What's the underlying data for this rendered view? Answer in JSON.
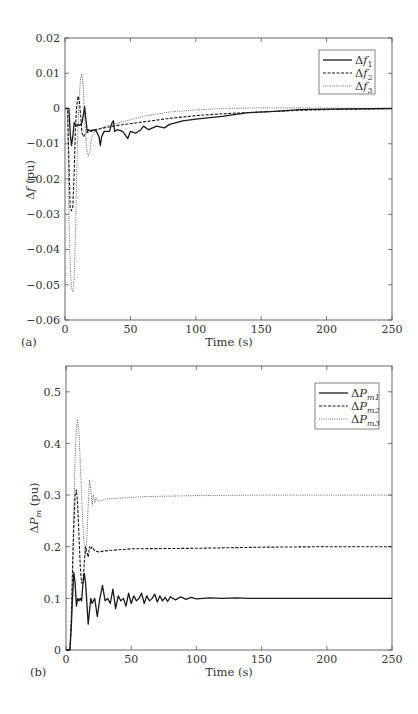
{
  "chart_data": [
    {
      "panel": "(a)",
      "type": "line",
      "title": "",
      "xlabel": "Time (s)",
      "ylabel": "Δf (pu)",
      "xlim": [
        0,
        250
      ],
      "ylim": [
        -0.06,
        0.02
      ],
      "xticks": [
        0,
        50,
        100,
        150,
        200,
        250
      ],
      "yticks": [
        -0.06,
        -0.05,
        -0.04,
        -0.03,
        -0.02,
        -0.01,
        0,
        0.01,
        0.02
      ],
      "ytick_labels": [
        "−0.06",
        "−0.05",
        "−0.04",
        "−0.03",
        "−0.02",
        "−0.01",
        "0",
        "0.01",
        "0.02"
      ],
      "grid": false,
      "legend_position": "upper right",
      "series": [
        {
          "name": "Δf1",
          "style": "solid",
          "x": [
            0,
            3,
            4,
            5,
            6,
            7,
            8,
            9,
            10,
            11,
            12,
            13,
            14,
            15,
            16,
            17,
            18,
            20,
            22,
            24,
            26,
            27,
            28,
            30,
            34,
            36,
            37,
            38,
            40,
            44,
            46,
            48,
            50,
            54,
            58,
            60,
            64,
            70,
            76,
            80,
            90,
            100,
            120,
            140,
            160,
            180,
            200,
            250
          ],
          "values": [
            0,
            0,
            -0.007,
            -0.0105,
            -0.008,
            -0.004,
            -0.0045,
            -0.005,
            -0.0045,
            -0.0048,
            -0.0045,
            -0.004,
            -0.002,
            0.0005,
            -0.003,
            -0.0065,
            -0.006,
            -0.0065,
            -0.006,
            -0.0065,
            -0.008,
            -0.0105,
            -0.008,
            -0.0065,
            -0.0065,
            -0.004,
            -0.0035,
            -0.0065,
            -0.006,
            -0.0065,
            -0.0075,
            -0.0085,
            -0.0065,
            -0.007,
            -0.006,
            -0.005,
            -0.006,
            -0.005,
            -0.0055,
            -0.0045,
            -0.0035,
            -0.003,
            -0.0022,
            -0.0012,
            -0.0008,
            -0.0003,
            -0.0002,
            0
          ]
        },
        {
          "name": "Δf2",
          "style": "dashed",
          "x": [
            0,
            2,
            3,
            4,
            5,
            6,
            7,
            8,
            9,
            10,
            11,
            12,
            13,
            14,
            15,
            16,
            20,
            30,
            40,
            60,
            80,
            100,
            120,
            150,
            180,
            200,
            250
          ],
          "values": [
            0,
            0,
            -0.015,
            -0.028,
            -0.029,
            -0.028,
            -0.018,
            -0.005,
            0.001,
            0.0035,
            0.002,
            -0.002,
            -0.007,
            -0.008,
            -0.0075,
            -0.007,
            -0.0062,
            -0.0055,
            -0.0048,
            -0.0038,
            -0.0028,
            -0.002,
            -0.0015,
            -0.001,
            -0.0005,
            -0.0003,
            0
          ]
        },
        {
          "name": "Δf3",
          "style": "dotted",
          "x": [
            0,
            2,
            3,
            4,
            5,
            6,
            7,
            8,
            9,
            10,
            11,
            12,
            13,
            14,
            15,
            16,
            17,
            18,
            19,
            20,
            22,
            25,
            30,
            40,
            60,
            80,
            100,
            120,
            150,
            200,
            250
          ],
          "values": [
            0,
            0,
            -0.03,
            -0.045,
            -0.051,
            -0.052,
            -0.048,
            -0.035,
            -0.018,
            -0.004,
            0.004,
            0.009,
            0.0098,
            0.006,
            -0.002,
            -0.009,
            -0.0125,
            -0.0135,
            -0.012,
            -0.009,
            -0.0065,
            -0.006,
            -0.0052,
            -0.0042,
            -0.0022,
            -0.001,
            -0.0004,
            0,
            0.0002,
            0.0001,
            0
          ]
        }
      ]
    },
    {
      "panel": "(b)",
      "type": "line",
      "title": "",
      "xlabel": "Time (s)",
      "ylabel": "ΔPm (pu)",
      "xlim": [
        0,
        250
      ],
      "ylim": [
        0,
        0.55
      ],
      "xticks": [
        0,
        50,
        100,
        150,
        200,
        250
      ],
      "yticks": [
        0,
        0.1,
        0.2,
        0.3,
        0.4,
        0.5
      ],
      "ytick_labels": [
        "0",
        "0.1",
        "0.2",
        "0.3",
        "0.4",
        "0.5"
      ],
      "grid": false,
      "legend_position": "upper right",
      "series": [
        {
          "name": "ΔPm1",
          "style": "solid",
          "x": [
            0,
            3,
            4,
            5,
            6,
            7,
            8,
            9,
            10,
            11,
            12,
            13,
            14,
            15,
            16,
            17,
            18,
            19,
            20,
            22,
            24,
            26,
            28,
            30,
            32,
            34,
            36,
            38,
            40,
            42,
            44,
            46,
            48,
            50,
            52,
            54,
            56,
            58,
            60,
            62,
            64,
            66,
            68,
            70,
            72,
            74,
            76,
            78,
            80,
            84,
            88,
            92,
            96,
            100,
            110,
            120,
            130,
            140,
            250
          ],
          "values": [
            0,
            0,
            0.04,
            0.1,
            0.15,
            0.13,
            0.085,
            0.1,
            0.095,
            0.1,
            0.095,
            0.13,
            0.148,
            0.13,
            0.09,
            0.05,
            0.075,
            0.1,
            0.09,
            0.1,
            0.065,
            0.1,
            0.125,
            0.095,
            0.1,
            0.09,
            0.118,
            0.08,
            0.105,
            0.095,
            0.1,
            0.085,
            0.11,
            0.09,
            0.105,
            0.095,
            0.1,
            0.11,
            0.09,
            0.105,
            0.095,
            0.1,
            0.108,
            0.093,
            0.105,
            0.095,
            0.102,
            0.094,
            0.103,
            0.097,
            0.103,
            0.098,
            0.102,
            0.099,
            0.101,
            0.1,
            0.101,
            0.1,
            0.1
          ]
        },
        {
          "name": "ΔPm2",
          "style": "dashed",
          "x": [
            0,
            3,
            4,
            5,
            6,
            7,
            8,
            9,
            10,
            11,
            12,
            13,
            14,
            15,
            16,
            17,
            18,
            19,
            20,
            22,
            25,
            30,
            40,
            50,
            100,
            150,
            200,
            250
          ],
          "values": [
            0,
            0,
            0.05,
            0.15,
            0.24,
            0.3,
            0.31,
            0.28,
            0.22,
            0.16,
            0.13,
            0.13,
            0.17,
            0.2,
            0.19,
            0.18,
            0.2,
            0.195,
            0.2,
            0.192,
            0.19,
            0.192,
            0.194,
            0.196,
            0.197,
            0.199,
            0.2,
            0.2
          ]
        },
        {
          "name": "ΔPm3",
          "style": "dotted",
          "x": [
            0,
            3,
            4,
            5,
            6,
            7,
            8,
            9,
            10,
            11,
            12,
            13,
            14,
            15,
            16,
            17,
            18,
            19,
            20,
            21,
            22,
            23,
            24,
            26,
            30,
            40,
            60,
            100,
            150,
            200,
            250
          ],
          "values": [
            0,
            0,
            0.06,
            0.16,
            0.27,
            0.37,
            0.43,
            0.445,
            0.42,
            0.36,
            0.3,
            0.24,
            0.2,
            0.185,
            0.22,
            0.28,
            0.33,
            0.31,
            0.28,
            0.3,
            0.285,
            0.295,
            0.29,
            0.288,
            0.292,
            0.294,
            0.297,
            0.299,
            0.3,
            0.3,
            0.3
          ]
        }
      ]
    }
  ],
  "panels": {
    "a": {
      "label": "(a)",
      "xlabel": "Time (s)",
      "ylabel_prefix": "Δ",
      "ylabel_var": "f",
      "ylabel_unit": " (pu)",
      "xtick_labels": [
        "0",
        "50",
        "100",
        "150",
        "200",
        "250"
      ],
      "ytick_labels": [
        "0.02",
        "0.01",
        "0",
        "−0.01",
        "−0.02",
        "−0.03",
        "−0.04",
        "−0.05",
        "−0.06"
      ],
      "legend": [
        {
          "prefix": "Δ",
          "var": "f",
          "sub": "1"
        },
        {
          "prefix": "Δ",
          "var": "f",
          "sub": "2"
        },
        {
          "prefix": "Δ",
          "var": "f",
          "sub": "3"
        }
      ]
    },
    "b": {
      "label": "(b)",
      "xlabel": "Time (s)",
      "ylabel_prefix": "Δ",
      "ylabel_var": "P",
      "ylabel_sub": "m",
      "ylabel_unit": " (pu)",
      "xtick_labels": [
        "0",
        "50",
        "100",
        "150",
        "200",
        "250"
      ],
      "ytick_labels": [
        "0.5",
        "0.4",
        "0.3",
        "0.2",
        "0.1",
        "0"
      ],
      "legend": [
        {
          "prefix": "Δ",
          "var": "P",
          "sub": "m1"
        },
        {
          "prefix": "Δ",
          "var": "P",
          "sub": "m2"
        },
        {
          "prefix": "Δ",
          "var": "P",
          "sub": "m3"
        }
      ]
    }
  },
  "colors": {
    "line_dark": "#1a1a1a",
    "line_dotted": "#555555",
    "axis": "#555555",
    "background": "#ffffff"
  }
}
